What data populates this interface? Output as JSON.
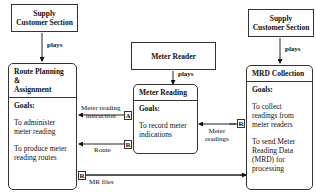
{
  "actors": [
    {
      "id": "supply-left",
      "label_line1": "Supply",
      "label_line2": "Customer Section"
    },
    {
      "id": "meter-reader",
      "label_line1": "Meter Reader",
      "label_line2": ""
    },
    {
      "id": "supply-right",
      "label_line1": "Supply",
      "label_line2": "Customer Section"
    }
  ],
  "plays_label": "plays",
  "roles": [
    {
      "title_line1": "Route Planning &",
      "title_line2": "Assignment",
      "goals_label": "Goals:",
      "goals": [
        "To administer meter reading",
        "To produce meter reading routes"
      ]
    },
    {
      "title_line1": "Meter Reading",
      "title_line2": "",
      "goals_label": "Goals:",
      "goals": [
        "To record meter indications"
      ]
    },
    {
      "title_line1": "MRD Collection",
      "title_line2": "",
      "goals_label": "Goals:",
      "goals": [
        "To collect readings from meter readers",
        "To send Meter Reading Data (MRD) for processing"
      ]
    }
  ],
  "flows": [
    {
      "label_line1": "Meter reading",
      "label_line2": "instruction",
      "tag": "A"
    },
    {
      "label_line1": "Route",
      "label_line2": "",
      "tag": "R"
    },
    {
      "label_line1": "Meter",
      "label_line2": "readings",
      "tag": "R"
    },
    {
      "label_line1": "MR files",
      "label_line2": "",
      "tag": "R"
    }
  ]
}
